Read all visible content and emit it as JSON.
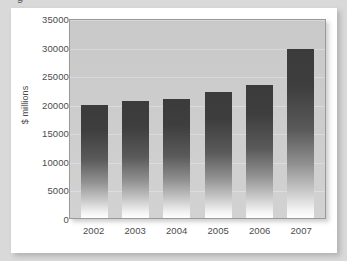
{
  "page": {
    "background_color": "#d9d9d9",
    "card_background": "#ffffff",
    "partial_caption": "g"
  },
  "chart_data": {
    "type": "bar",
    "title": "",
    "xlabel": "",
    "ylabel": "$ millions",
    "categories": [
      "2002",
      "2003",
      "2004",
      "2005",
      "2006",
      "2007"
    ],
    "values": [
      19700,
      20400,
      20800,
      22000,
      23300,
      29500
    ],
    "series": [
      {
        "name": "$ millions",
        "values": [
          19700,
          20400,
          20800,
          22000,
          23300,
          29500
        ]
      }
    ],
    "ylim": [
      0,
      35000
    ],
    "y_ticks": [
      0,
      5000,
      10000,
      15000,
      20000,
      25000,
      30000,
      35000
    ],
    "y_tick_labels": [
      "0",
      "5000",
      "10000",
      "15000",
      "20000",
      "25000",
      "30000",
      "35000"
    ],
    "grid": true,
    "legend": false,
    "legend_position": "none",
    "plot_background_color": "#cdcdcd",
    "bar_color_top": "#3b3b3b",
    "bar_color_bottom": "#ffffff",
    "axis_text_color": "#4c4c4c"
  }
}
